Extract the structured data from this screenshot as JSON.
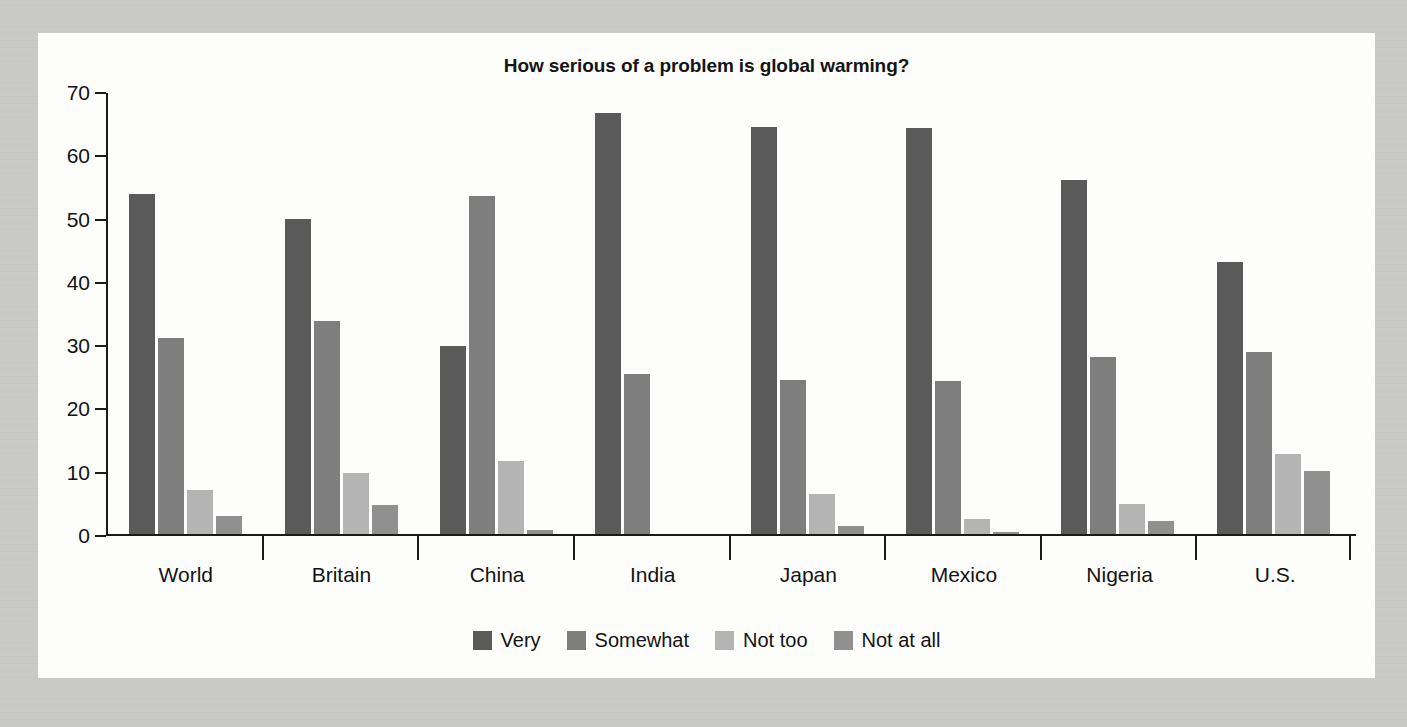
{
  "chart_data": {
    "type": "bar",
    "title": "How serious of a problem is global warming?",
    "xlabel": "",
    "ylabel": "",
    "ylim": [
      0,
      70
    ],
    "yticks": [
      0,
      10,
      20,
      30,
      40,
      50,
      60,
      70
    ],
    "grid": false,
    "legend_position": "bottom",
    "categories": [
      "World",
      "Britain",
      "China",
      "India",
      "Japan",
      "Mexico",
      "Nigeria",
      "U.S."
    ],
    "series": [
      {
        "name": "Very",
        "color": "#5a5a5a",
        "values": [
          53.8,
          49.7,
          29.7,
          66.5,
          64.3,
          64.2,
          56.0,
          43.0
        ]
      },
      {
        "name": "Somewhat",
        "color": "#7e7e7e",
        "values": [
          31.0,
          33.6,
          53.4,
          25.3,
          24.3,
          24.2,
          28.0,
          28.7
        ]
      },
      {
        "name": "Not too",
        "color": "#b4b4b4",
        "values": [
          6.9,
          9.7,
          11.6,
          0,
          6.3,
          2.3,
          4.8,
          12.7
        ]
      },
      {
        "name": "Not at all",
        "color": "#909090",
        "values": [
          2.9,
          4.6,
          0.6,
          0,
          1.2,
          0.3,
          2.0,
          9.9
        ]
      }
    ]
  }
}
